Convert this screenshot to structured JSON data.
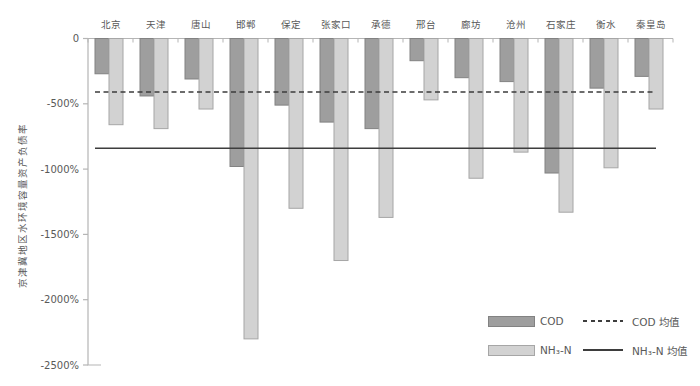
{
  "chart_data": {
    "type": "bar",
    "title": "",
    "ylabel": "京津冀地区水环境容量资产负债率",
    "xlabel": "",
    "ylim": [
      0,
      -2500
    ],
    "grid": false,
    "legend_position": "bottom-right",
    "categories": [
      "北京",
      "天津",
      "唐山",
      "邯郸",
      "保定",
      "张家口",
      "承德",
      "邢台",
      "廊坊",
      "沧州",
      "石家庄",
      "衡水",
      "秦皇岛"
    ],
    "series": [
      {
        "name": "COD",
        "values": [
          -270,
          -440,
          -310,
          -980,
          -510,
          -640,
          -690,
          -170,
          -300,
          -330,
          -1030,
          -380,
          -290
        ]
      },
      {
        "name": "NH₃-N",
        "values": [
          -660,
          -690,
          -540,
          -2300,
          -1300,
          -1700,
          -1370,
          -470,
          -1070,
          -870,
          -1330,
          -990,
          -540
        ]
      }
    ],
    "ref_lines": [
      {
        "name": "COD 均值",
        "value": -410,
        "style": "dashed"
      },
      {
        "name": "NH₃-N 均值",
        "value": -840,
        "style": "solid"
      }
    ],
    "y_ticks": [
      {
        "label": "0",
        "value": 0
      },
      {
        "label": "-500%",
        "value": -500
      },
      {
        "label": "-1000%",
        "value": -1000
      },
      {
        "label": "-1500%",
        "value": -1500
      },
      {
        "label": "-2000%",
        "value": -2000
      },
      {
        "label": "-2500%",
        "value": -2500
      }
    ],
    "colors": {
      "cod_fill": "#9e9e9e",
      "cod_border": "#828282",
      "nh3_fill": "#d2d2d2",
      "nh3_border": "#a6a6a6",
      "ref_line": "#3d3d3d",
      "axis": "#b5b5b5",
      "text": "#595959"
    }
  },
  "legend": {
    "cod_label": "COD",
    "nh3_label": "NH₃-N",
    "cod_mean_label": "COD 均值",
    "nh3_mean_label": "NH₃-N 均值"
  }
}
